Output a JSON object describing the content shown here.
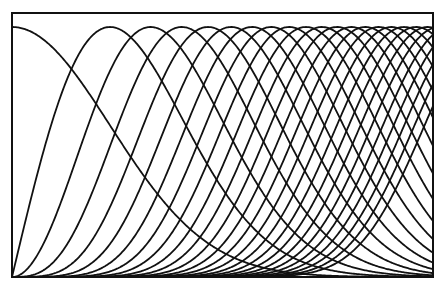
{
  "chart_data": {
    "type": "line",
    "title": "",
    "xlabel": "",
    "ylabel": "",
    "grid": false,
    "legend": null,
    "xlim": [
      0,
      4.29
    ],
    "ylim": [
      0,
      1
    ],
    "k_values": [
      0,
      1,
      2,
      3,
      4,
      5,
      6,
      7,
      8,
      9,
      10,
      11,
      12,
      13,
      14,
      15,
      16,
      17,
      18,
      19,
      20,
      21,
      22,
      23,
      24
    ],
    "peak_u": [
      0,
      1,
      1.414,
      1.732,
      2,
      2.236,
      2.449,
      2.646,
      2.828,
      3,
      3.162,
      3.317,
      3.464,
      3.606,
      3.742,
      3.873,
      4,
      4.123,
      4.243,
      4.359,
      4.472,
      4.583,
      4.69,
      4.796,
      4.899
    ],
    "peak_value": 1.0,
    "series_sample_x": [
      0,
      0.5,
      1,
      1.5,
      2,
      2.5,
      3,
      3.5,
      4
    ],
    "series": [
      {
        "name": "k=0",
        "values": [
          1.0,
          0.882,
          0.607,
          0.325,
          0.135,
          0.044,
          0.011,
          0.002,
          0.0
        ]
      },
      {
        "name": "k=1",
        "values": [
          0.0,
          0.727,
          1.0,
          0.803,
          0.446,
          0.181,
          0.055,
          0.013,
          0.002
        ]
      },
      {
        "name": "k=2",
        "values": [
          0.0,
          0.212,
          0.824,
          0.994,
          0.736,
          0.373,
          0.136,
          0.037,
          0.008
        ]
      },
      {
        "name": "k=4",
        "values": [
          0.0,
          0.006,
          0.213,
          0.724,
          1.0,
          0.792,
          0.412,
          0.155,
          0.044
        ]
      },
      {
        "name": "k=9",
        "values": [
          0.0,
          0.0,
          0.001,
          0.039,
          0.307,
          0.775,
          0.999,
          0.778,
          0.383
        ]
      },
      {
        "name": "k=16",
        "values": [
          0.0,
          0.0,
          0.0,
          0.0,
          0.004,
          0.087,
          0.456,
          0.901,
          0.999
        ]
      }
    ]
  },
  "frame": {
    "left": 12,
    "top": 13,
    "right": 433,
    "bottom": 277,
    "plot_top": 27,
    "plot_bottom": 277,
    "x_scale_px_per_unit": 98
  },
  "colors": {
    "line": "#111111",
    "background": "#ffffff"
  }
}
